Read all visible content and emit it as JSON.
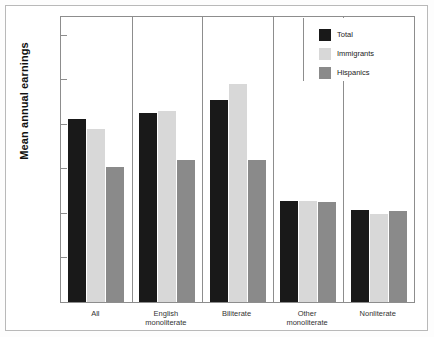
{
  "chart_data": {
    "type": "bar",
    "title": "",
    "xlabel": "",
    "ylabel": "Mean annual earnings",
    "ylim": [
      0,
      32000
    ],
    "grid": false,
    "legend_position": "top-right",
    "categories": [
      "All",
      "English monoliterate",
      "Biliterate",
      "Other monoliterate",
      "Nonliterate"
    ],
    "category_lines": [
      [
        "All"
      ],
      [
        "English",
        "monoliterate"
      ],
      [
        "Biliterate"
      ],
      [
        "Other",
        "monoliterate"
      ],
      [
        "Nonliterate"
      ]
    ],
    "ytick_labels": [
      "0",
      "$5,000",
      "$10,000",
      "$15,000",
      "$20,000",
      "$25,000",
      "$30,000"
    ],
    "ytick_values": [
      0,
      5000,
      10000,
      15000,
      20000,
      25000,
      30000
    ],
    "series": [
      {
        "name": "Total",
        "color": "#191919",
        "values": [
          20600,
          21200,
          22700,
          11300,
          10300
        ]
      },
      {
        "name": "Immigrants",
        "color": "#d8d8d8",
        "values": [
          19400,
          21500,
          24500,
          11300,
          9900
        ]
      },
      {
        "name": "Hispanics",
        "color": "#8a8a8a",
        "values": [
          15200,
          16000,
          16000,
          11200,
          10200
        ]
      }
    ]
  },
  "legend": {
    "items": [
      {
        "label": "Total",
        "swatch": "black-swatch"
      },
      {
        "label": "Immigrants",
        "swatch": "light-gray-swatch"
      },
      {
        "label": "Hispanics",
        "swatch": "medium-gray-swatch"
      }
    ]
  },
  "colors": {
    "total": "#191919",
    "immigrants": "#d8d8d8",
    "hispanics": "#8a8a8a",
    "frame": "#8d8d8d",
    "outer_border": "#b9b9b9",
    "background": "#ffffff"
  }
}
